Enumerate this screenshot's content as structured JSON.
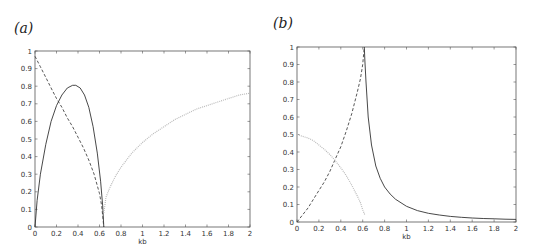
{
  "chart_data": [
    {
      "panel_label": "(a)",
      "type": "line",
      "title": "",
      "xlabel": "kb",
      "ylabel": "",
      "xlim": [
        0,
        2
      ],
      "ylim": [
        0,
        1
      ],
      "xticks": [
        "0",
        "0.2",
        "0.4",
        "0.6",
        "0.8",
        "1",
        "1.2",
        "1.4",
        "1.6",
        "1.8",
        "2"
      ],
      "yticks": [
        "0",
        "0.1",
        "0.2",
        "0.3",
        "0.4",
        "0.5",
        "0.6",
        "0.7",
        "0.8",
        "0.9",
        "1"
      ],
      "grid": false,
      "legend": null,
      "series": [
        {
          "name": "solid",
          "style": "solid",
          "color": "#333333",
          "x": [
            0,
            0.02,
            0.05,
            0.1,
            0.15,
            0.2,
            0.25,
            0.3,
            0.35,
            0.38,
            0.42,
            0.46,
            0.5,
            0.54,
            0.58,
            0.61,
            0.63,
            0.64
          ],
          "y": [
            0,
            0.15,
            0.3,
            0.47,
            0.6,
            0.69,
            0.75,
            0.79,
            0.805,
            0.805,
            0.79,
            0.75,
            0.68,
            0.57,
            0.42,
            0.26,
            0.12,
            0
          ]
        },
        {
          "name": "dashed",
          "style": "dashed",
          "color": "#444444",
          "x": [
            0,
            0.05,
            0.1,
            0.15,
            0.2,
            0.25,
            0.3,
            0.35,
            0.4,
            0.45,
            0.5,
            0.55,
            0.6,
            0.62,
            0.64
          ],
          "y": [
            0.97,
            0.91,
            0.85,
            0.79,
            0.73,
            0.68,
            0.62,
            0.57,
            0.51,
            0.45,
            0.38,
            0.3,
            0.19,
            0.12,
            0
          ]
        },
        {
          "name": "dotted",
          "style": "dotted",
          "color": "#bbbbbb",
          "x": [
            0.64,
            0.66,
            0.7,
            0.75,
            0.8,
            0.9,
            1.0,
            1.1,
            1.2,
            1.3,
            1.4,
            1.5,
            1.6,
            1.7,
            1.8,
            1.9,
            2.0
          ],
          "y": [
            0.08,
            0.17,
            0.23,
            0.29,
            0.34,
            0.42,
            0.48,
            0.53,
            0.57,
            0.61,
            0.64,
            0.67,
            0.69,
            0.71,
            0.73,
            0.75,
            0.76
          ]
        }
      ]
    },
    {
      "panel_label": "(b)",
      "type": "line",
      "title": "",
      "xlabel": "kb",
      "ylabel": "",
      "xlim": [
        0,
        2
      ],
      "ylim": [
        0,
        1
      ],
      "xticks": [
        "0",
        "0.2",
        "0.4",
        "0.6",
        "0.8",
        "1",
        "1.2",
        "1.4",
        "1.6",
        "1.8",
        "2"
      ],
      "yticks": [
        "0",
        "0.1",
        "0.2",
        "0.3",
        "0.4",
        "0.5",
        "0.6",
        "0.7",
        "0.8",
        "0.9",
        "1"
      ],
      "grid": false,
      "legend": null,
      "series": [
        {
          "name": "solid",
          "style": "solid",
          "color": "#333333",
          "x": [
            0.615,
            0.62,
            0.63,
            0.65,
            0.68,
            0.72,
            0.76,
            0.8,
            0.85,
            0.9,
            1.0,
            1.1,
            1.2,
            1.3,
            1.4,
            1.5,
            1.6,
            1.7,
            1.8,
            1.9,
            2.0
          ],
          "y": [
            1.0,
            0.92,
            0.8,
            0.6,
            0.44,
            0.32,
            0.25,
            0.2,
            0.16,
            0.13,
            0.09,
            0.065,
            0.05,
            0.04,
            0.032,
            0.027,
            0.023,
            0.02,
            0.018,
            0.016,
            0.015
          ]
        },
        {
          "name": "dashed",
          "style": "dashed",
          "color": "#444444",
          "x": [
            0,
            0.05,
            0.1,
            0.15,
            0.2,
            0.25,
            0.3,
            0.35,
            0.4,
            0.45,
            0.5,
            0.55,
            0.58,
            0.6,
            0.615
          ],
          "y": [
            0,
            0.04,
            0.08,
            0.13,
            0.18,
            0.23,
            0.29,
            0.36,
            0.43,
            0.52,
            0.62,
            0.74,
            0.82,
            0.9,
            1.0
          ]
        },
        {
          "name": "dotted",
          "style": "dotted",
          "color": "#bbbbbb",
          "x": [
            0,
            0.05,
            0.1,
            0.15,
            0.2,
            0.25,
            0.3,
            0.35,
            0.4,
            0.45,
            0.5,
            0.55,
            0.58,
            0.6,
            0.62
          ],
          "y": [
            0.5,
            0.49,
            0.48,
            0.465,
            0.44,
            0.415,
            0.385,
            0.35,
            0.31,
            0.265,
            0.21,
            0.15,
            0.11,
            0.07,
            0.04
          ]
        }
      ]
    }
  ],
  "panels": [
    {
      "label": "(a)",
      "xlabel": "kb"
    },
    {
      "label": "(b)",
      "xlabel": "kb"
    }
  ]
}
